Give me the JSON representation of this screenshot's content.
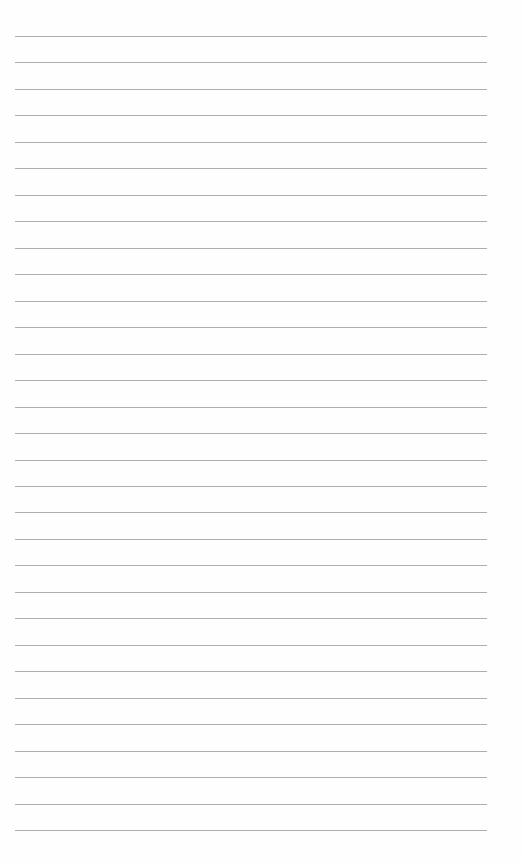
{
  "page": {
    "type": "lined-paper",
    "line_count": 31,
    "first_line_y": 36,
    "line_spacing": 26.47,
    "line_left": 15,
    "line_width": 472,
    "line_color": "#9a9a9a",
    "background_color": "#fefefe"
  }
}
